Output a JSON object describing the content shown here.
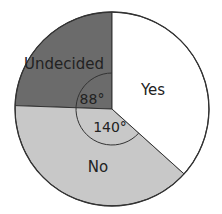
{
  "chart_data": {
    "type": "pie",
    "title": "",
    "categories": [
      "Yes",
      "Undecided",
      "No"
    ],
    "values": [
      132,
      88,
      140
    ],
    "units": "degrees",
    "annotations": [
      {
        "slice": "Undecided",
        "text": "88°"
      },
      {
        "slice": "No",
        "text": "140°"
      }
    ],
    "colors": {
      "Yes": "#ffffff",
      "Undecided": "#6b6b6b",
      "No": "#c8c8c8"
    },
    "legend": "none",
    "labels_inside": true
  },
  "labels": {
    "yes": "Yes",
    "undecided": "Undecided",
    "no": "No",
    "angle_undecided": "88°",
    "angle_no": "140°"
  },
  "geometry": {
    "cx": 112,
    "cy": 109,
    "r": 97,
    "arc_r": 36
  }
}
